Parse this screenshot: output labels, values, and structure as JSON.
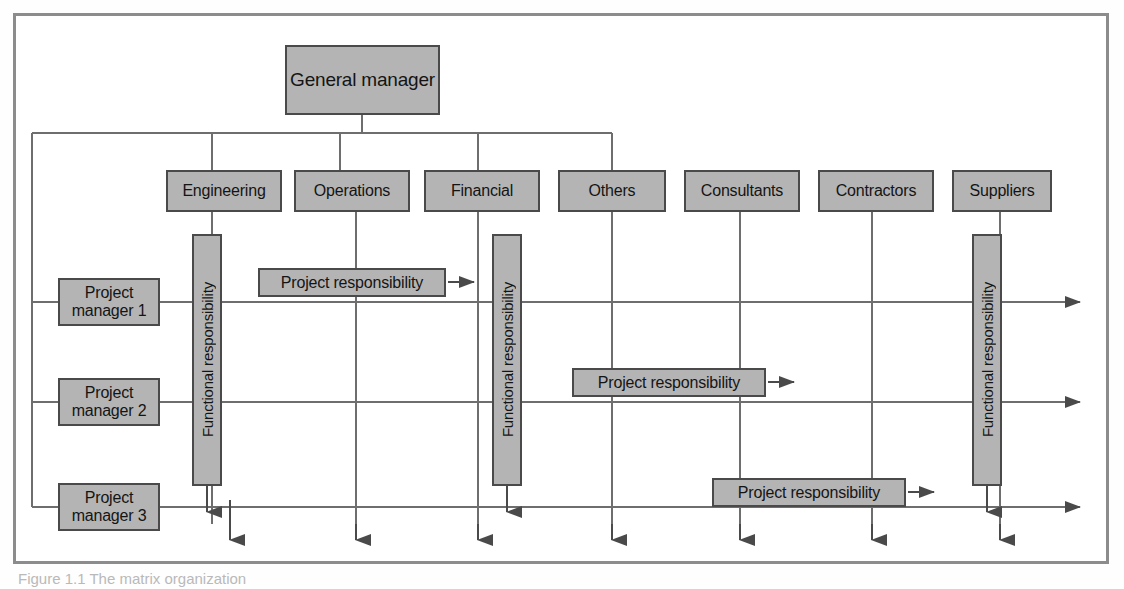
{
  "figure": {
    "caption": "Figure 1.1   The matrix organization"
  },
  "colors": {
    "box_fill": "#b4b4b4",
    "box_border": "#4a4a4a",
    "line": "#6e6e6e",
    "arrow": "#4a4a4a",
    "frame": "#8c8c8c",
    "page": "#ffffff"
  },
  "top": {
    "general_manager": "General manager"
  },
  "departments": [
    {
      "label": "Engineering",
      "x": 166,
      "connected_to_gm": true
    },
    {
      "label": "Operations",
      "x": 294,
      "connected_to_gm": true
    },
    {
      "label": "Financial",
      "x": 424,
      "connected_to_gm": true
    },
    {
      "label": "Others",
      "x": 558,
      "connected_to_gm": true
    },
    {
      "label": "Consultants",
      "x": 684,
      "connected_to_gm": false
    },
    {
      "label": "Contractors",
      "x": 818,
      "connected_to_gm": false
    },
    {
      "label": "Suppliers",
      "x": 952,
      "connected_to_gm": false
    }
  ],
  "project_managers": [
    {
      "label": "Project\nmanager 1",
      "line1": "Project",
      "line2": "manager 1",
      "y": 302
    },
    {
      "label": "Project\nmanager 2",
      "line1": "Project",
      "line2": "manager 2",
      "y": 402
    },
    {
      "label": "Project\nmanager 3",
      "line1": "Project",
      "line2": "manager 3",
      "y": 507
    }
  ],
  "functional_responsibility": {
    "label": "Functional responsibility",
    "instances": [
      {
        "column": "Engineering",
        "x": 188
      },
      {
        "column": "Financial",
        "x": 488
      },
      {
        "column": "Suppliers",
        "x": 968
      }
    ]
  },
  "project_responsibility": {
    "label": "Project responsibility",
    "instances": [
      {
        "row": "Project manager 1",
        "x": 258,
        "width": 188,
        "y": 268
      },
      {
        "row": "Project manager 2",
        "x": 572,
        "width": 194,
        "y": 368
      },
      {
        "row": "Project manager 3",
        "x": 712,
        "width": 194,
        "y": 478
      }
    ]
  }
}
